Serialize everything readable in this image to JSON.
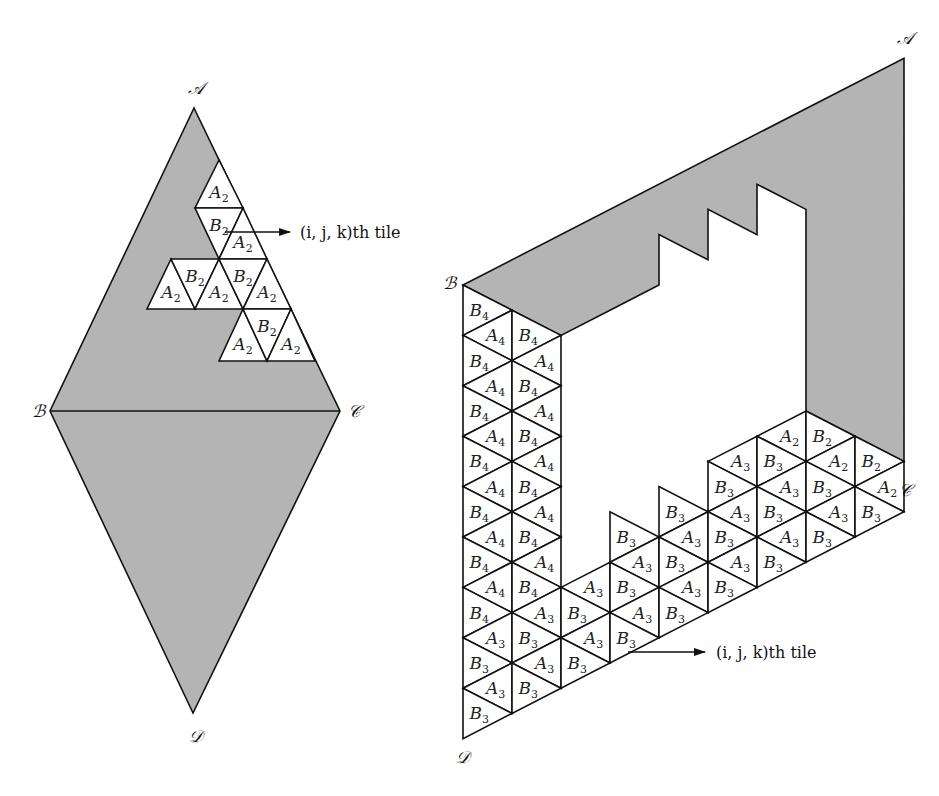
{
  "figure": {
    "left_panel": {
      "vertices": [
        {
          "name": "A",
          "label": "𝒜",
          "x": 194,
          "y": 108,
          "lx": 196,
          "ly": 94
        },
        {
          "name": "B",
          "label": "ℬ",
          "x": 50,
          "y": 411,
          "lx": 38,
          "ly": 417
        },
        {
          "name": "C",
          "label": "𝒞",
          "x": 340,
          "y": 411,
          "lx": 354,
          "ly": 417
        },
        {
          "name": "D",
          "label": "𝒟",
          "x": 193,
          "y": 713,
          "lx": 196,
          "ly": 742
        }
      ],
      "tile_rows_y": [
        160,
        208,
        259,
        309,
        361
      ],
      "tile_row_x0": [
        219,
        195,
        171,
        147,
        123
      ],
      "tile_step": 48,
      "tiles": [
        {
          "row": 0,
          "col": 0,
          "dir": "up",
          "letter": "A",
          "index": "2"
        },
        {
          "row": 1,
          "col": 0,
          "dir": "down",
          "letter": "B",
          "index": "2"
        },
        {
          "row": 1,
          "col": 1,
          "dir": "up",
          "letter": "A",
          "index": "2"
        },
        {
          "row": 2,
          "col": 0,
          "dir": "up",
          "letter": "A",
          "index": "2"
        },
        {
          "row": 2,
          "col": 0,
          "dir": "down",
          "letter": "B",
          "index": "2"
        },
        {
          "row": 2,
          "col": 1,
          "dir": "up",
          "letter": "A",
          "index": "2"
        },
        {
          "row": 2,
          "col": 1,
          "dir": "down",
          "letter": "B",
          "index": "2"
        },
        {
          "row": 2,
          "col": 2,
          "dir": "up",
          "letter": "A",
          "index": "2"
        },
        {
          "row": 3,
          "col": 2,
          "dir": "up",
          "letter": "A",
          "index": "2"
        },
        {
          "row": 3,
          "col": 2,
          "dir": "down",
          "letter": "B",
          "index": "2"
        },
        {
          "row": 3,
          "col": 3,
          "dir": "up",
          "letter": "A",
          "index": "2"
        }
      ],
      "arrow": {
        "x1": 225,
        "y1": 232,
        "x2": 290,
        "y2": 232
      },
      "arrow_label": "(i, j, k)th tile",
      "arrow_label_pos": {
        "x": 300,
        "y": 238
      }
    },
    "right_panel": {
      "lattice": {
        "x0": 463,
        "dx": 49,
        "y0": 285,
        "dy": 25.2
      },
      "vertices": [
        {
          "name": "A",
          "label": "𝒜",
          "col": 9,
          "lev": -9,
          "lx": 905,
          "ly": 44
        },
        {
          "name": "B",
          "label": "ℬ",
          "col": 0,
          "lev": 0,
          "lx": 449,
          "ly": 289
        },
        {
          "name": "C",
          "label": "𝒞",
          "col": 9,
          "lev": 9,
          "lx": 905,
          "ly": 496
        },
        {
          "name": "D",
          "label": "𝒟",
          "col": 0,
          "lev": 18,
          "lx": 463,
          "ly": 763
        }
      ],
      "gray_polygon": [
        [
          0,
          0
        ],
        [
          9,
          -9
        ],
        [
          9,
          7
        ],
        [
          8,
          6
        ],
        [
          7,
          5
        ],
        [
          7,
          -3
        ],
        [
          6,
          -4
        ],
        [
          6,
          -2
        ],
        [
          5,
          -3
        ],
        [
          5,
          -1
        ],
        [
          4,
          -2
        ],
        [
          4,
          0
        ],
        [
          3,
          1
        ],
        [
          2,
          2
        ],
        [
          1,
          1
        ],
        [
          0,
          0
        ]
      ],
      "strips": [
        {
          "strip": 0,
          "k_start": 0,
          "labels": [
            "B4",
            "A4",
            "B4",
            "A4",
            "B4",
            "A4",
            "B4",
            "A4",
            "B4",
            "A4",
            "B4",
            "A4",
            "B4",
            "A3",
            "B3",
            "A3",
            "B3"
          ]
        },
        {
          "strip": 1,
          "k_start": 1,
          "labels": [
            "B4",
            "A4",
            "B4",
            "A4",
            "B4",
            "A4",
            "B4",
            "A4",
            "B4",
            "A4",
            "B4",
            "A3",
            "B3",
            "A3",
            "B3"
          ]
        },
        {
          "strip": 2,
          "k_start": 11,
          "labels": [
            "A3",
            "B3",
            "A3",
            "B3"
          ]
        },
        {
          "strip": 3,
          "k_start": 9,
          "labels": [
            "B3",
            "A3",
            "B3",
            "A3",
            "B3"
          ]
        },
        {
          "strip": 4,
          "k_start": 8,
          "labels": [
            "B3",
            "A3",
            "B3",
            "A3",
            "B3"
          ]
        },
        {
          "strip": 5,
          "k_start": 6,
          "labels": [
            "A3",
            "B3",
            "A3",
            "B3",
            "A3",
            "B3"
          ]
        },
        {
          "strip": 6,
          "k_start": 5,
          "labels": [
            "A2",
            "B3",
            "A3",
            "B3",
            "A3",
            "B3"
          ]
        },
        {
          "strip": 7,
          "k_start": 5,
          "labels": [
            "B2",
            "A2",
            "B3",
            "A3",
            "B3"
          ]
        },
        {
          "strip": 8,
          "k_start": 6,
          "labels": [
            "B2",
            "A2",
            "B3"
          ]
        }
      ],
      "arrow": {
        "x1": 628,
        "y1": 652,
        "x2": 705,
        "y2": 652
      },
      "arrow_label": "(i, j, k)th tile",
      "arrow_label_pos": {
        "x": 716,
        "y": 658
      }
    }
  }
}
